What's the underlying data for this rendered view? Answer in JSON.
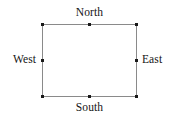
{
  "diagram": {
    "type": "rectangle-with-compass-labels",
    "background_color": "#ffffff",
    "edge_color": "#8a8a8a",
    "node_color": "#1a1a1a",
    "text_color": "#141414",
    "labels": {
      "north": "North",
      "south": "South",
      "west": "West",
      "east": "East"
    },
    "shape": {
      "left": 42,
      "top": 24,
      "right": 136,
      "bottom": 96,
      "width": 94,
      "height": 72
    },
    "nodes": [
      {
        "id": "nw",
        "name": "north-west-corner",
        "x": 42,
        "y": 24
      },
      {
        "id": "n",
        "name": "north-midpoint",
        "x": 89,
        "y": 24
      },
      {
        "id": "ne",
        "name": "north-east-corner",
        "x": 136,
        "y": 24
      },
      {
        "id": "w",
        "name": "west-midpoint",
        "x": 42,
        "y": 60
      },
      {
        "id": "e",
        "name": "east-midpoint",
        "x": 136,
        "y": 60
      },
      {
        "id": "sw",
        "name": "south-west-corner",
        "x": 42,
        "y": 96
      },
      {
        "id": "s",
        "name": "south-midpoint",
        "x": 89,
        "y": 96
      },
      {
        "id": "se",
        "name": "south-east-corner",
        "x": 136,
        "y": 96
      }
    ]
  }
}
